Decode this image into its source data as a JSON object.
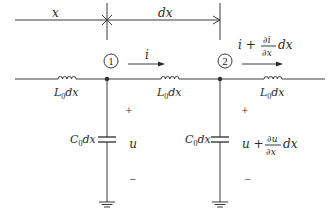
{
  "diagram": {
    "type": "transmission-line-element",
    "dimension": {
      "x_label": "x",
      "dx_label": "dx"
    },
    "nodes": [
      {
        "id": "1",
        "label": "1"
      },
      {
        "id": "2",
        "label": "2"
      }
    ],
    "currents": {
      "i1": "i",
      "i2_main": "i +",
      "i2_num": "∂i",
      "i2_den": "∂x",
      "i2_tail": "dx"
    },
    "inductors": [
      {
        "label_main": "L",
        "label_sub": "0",
        "label_tail": "dx"
      },
      {
        "label_main": "L",
        "label_sub": "0",
        "label_tail": "dx"
      },
      {
        "label_main": "L",
        "label_sub": "0",
        "label_tail": "dx"
      }
    ],
    "capacitors": [
      {
        "label_main": "C",
        "label_sub": "0",
        "label_tail": "dx"
      },
      {
        "label_main": "C",
        "label_sub": "0",
        "label_tail": "dx"
      }
    ],
    "voltages": {
      "plus": "+",
      "minus": "−",
      "u1": "u",
      "u2_main": "u +",
      "u2_num": "∂u",
      "u2_den": "∂x",
      "u2_tail": "dx"
    },
    "colors": {
      "line": "#3a3a3a",
      "text": "#2a2a2a",
      "background": "#ffffff"
    }
  }
}
